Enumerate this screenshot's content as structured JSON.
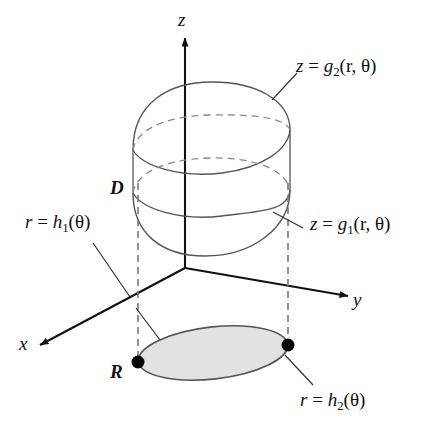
{
  "figure": {
    "background_color": "#ffffff",
    "line_color": "#111111",
    "surface_line_color": "#555555",
    "dashed_line_color": "#777777",
    "region_fill_color": "#e2e2e2",
    "region_stroke_color": "#555555",
    "point_color": "#000000"
  },
  "axes": {
    "z": {
      "label": "z"
    },
    "y": {
      "label": "y"
    },
    "x": {
      "label": "x"
    }
  },
  "labels": {
    "solid_region": "D",
    "plane_region": "R",
    "upper_surface": {
      "lhs": "z",
      "eq": "=",
      "fn": "g",
      "sub": "2",
      "args": "(r, θ)"
    },
    "lower_surface": {
      "lhs": "z",
      "eq": "=",
      "fn": "g",
      "sub": "1",
      "args": "(r, θ)"
    },
    "inner_radius": {
      "lhs": "r",
      "eq": "=",
      "fn": "h",
      "sub": "1",
      "args": "(θ)"
    },
    "outer_radius": {
      "lhs": "r",
      "eq": "=",
      "fn": "h",
      "sub": "2",
      "args": "(θ)"
    }
  },
  "points": [
    {
      "name": "region-left-point",
      "x": 138,
      "y": 362
    },
    {
      "name": "region-right-point",
      "x": 288,
      "y": 345
    }
  ]
}
